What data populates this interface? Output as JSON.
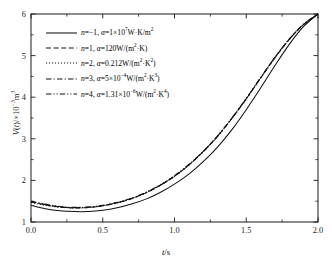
{
  "chart_data": {
    "type": "line",
    "title": "",
    "xlabel": "t/s",
    "ylabel": "V(t)/×10⁻³m³",
    "xlim": [
      0.0,
      2.0
    ],
    "ylim": [
      1,
      6
    ],
    "grid": false,
    "legend_position": "upper-left",
    "xticks": [
      "0.0",
      "0.5",
      "1.0",
      "1.5",
      "2.0"
    ],
    "xtick_values": [
      0.0,
      0.5,
      1.0,
      1.5,
      2.0
    ],
    "yticks": [
      "1",
      "2",
      "3",
      "4",
      "5",
      "6"
    ],
    "ytick_values": [
      1,
      2,
      3,
      4,
      5,
      6
    ],
    "x_minor_ticks": [
      0.25,
      0.75,
      1.25,
      1.75
    ],
    "y_minor_ticks": [
      1.5,
      2.5,
      3.5,
      4.5,
      5.5
    ],
    "x": [
      0.0,
      0.1,
      0.2,
      0.3,
      0.4,
      0.5,
      0.6,
      0.7,
      0.8,
      0.9,
      1.0,
      1.1,
      1.2,
      1.3,
      1.4,
      1.5,
      1.6,
      1.7,
      1.8,
      1.9,
      2.0
    ],
    "series": [
      {
        "name": "n = −1",
        "style": "solid",
        "values": [
          1.4,
          1.32,
          1.27,
          1.25,
          1.25,
          1.28,
          1.34,
          1.43,
          1.55,
          1.71,
          1.91,
          2.15,
          2.45,
          2.8,
          3.22,
          3.7,
          4.22,
          4.76,
          5.27,
          5.7,
          6.0
        ]
      },
      {
        "name": "n = 1",
        "style": "dashed",
        "values": [
          1.48,
          1.41,
          1.36,
          1.34,
          1.35,
          1.39,
          1.46,
          1.56,
          1.7,
          1.88,
          2.1,
          2.37,
          2.69,
          3.06,
          3.49,
          3.96,
          4.46,
          4.95,
          5.39,
          5.75,
          6.0
        ]
      },
      {
        "name": "n = 2",
        "style": "dotted",
        "values": [
          1.47,
          1.4,
          1.355,
          1.337,
          1.347,
          1.387,
          1.458,
          1.558,
          1.697,
          1.877,
          2.095,
          2.365,
          2.685,
          3.055,
          3.485,
          3.955,
          4.455,
          4.945,
          5.385,
          5.748,
          6.0
        ]
      },
      {
        "name": "n = 3",
        "style": "dashdot",
        "values": [
          1.49,
          1.42,
          1.365,
          1.345,
          1.355,
          1.395,
          1.465,
          1.565,
          1.705,
          1.885,
          2.105,
          2.375,
          2.695,
          3.065,
          3.495,
          3.965,
          4.465,
          4.955,
          5.395,
          5.752,
          6.0
        ]
      },
      {
        "name": "n = 4",
        "style": "dashdotdot",
        "values": [
          1.5,
          1.43,
          1.372,
          1.352,
          1.362,
          1.402,
          1.472,
          1.572,
          1.712,
          1.892,
          2.112,
          2.382,
          2.702,
          3.072,
          3.502,
          3.972,
          4.472,
          4.962,
          5.4,
          5.755,
          6.0
        ]
      }
    ],
    "legend": [
      {
        "style": "solid",
        "n_label": "n",
        "n_value": "−1",
        "alpha_label": "α",
        "alpha_value": "1×10⁷W·K/m²",
        "text": "n =−1, α = 1×10⁷W·K/m²"
      },
      {
        "style": "dashed",
        "n_label": "n",
        "n_value": "1",
        "alpha_label": "α",
        "alpha_value": "120W/(m²·K)",
        "text": "n = 1, α = 120W/(m²·K)"
      },
      {
        "style": "dotted",
        "n_label": "n",
        "n_value": "2",
        "alpha_label": "α",
        "alpha_value": "0.212W/(m²·K²)",
        "text": "n = 2, α = 0.212W/(m²·K²)"
      },
      {
        "style": "dashdot",
        "n_label": "n",
        "n_value": "3",
        "alpha_label": "α",
        "alpha_value": "5×10⁻⁴W/(m²·K³)",
        "text": "n = 3, α = 5×10⁻⁴W/(m²·K³)"
      },
      {
        "style": "dashdotdot",
        "n_label": "n",
        "n_value": "4",
        "alpha_label": "α",
        "alpha_value": "1.31×10⁻⁶W/(m²·K⁴)",
        "text": "n = 4, α = 1.31×10⁻⁶W/(m²·K⁴)"
      }
    ],
    "colors": {
      "axis": "#1a1a1a",
      "curve": "#111111",
      "background": "#ffffff"
    }
  }
}
